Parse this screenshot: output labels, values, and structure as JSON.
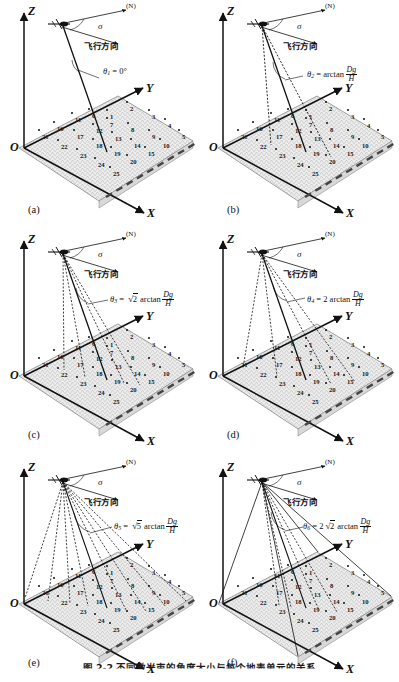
{
  "figure": {
    "caption": "图 2-2  不同激光束的角度大小与每个地表单元的关系",
    "axes": {
      "z": "Z",
      "y": "Y",
      "x": "X",
      "origin": "O"
    },
    "annotations": {
      "north": "(N)",
      "sigma": "σ",
      "flight_direction": "飞行方向",
      "arctan": "arctan",
      "dg": "Dg",
      "h": "H"
    },
    "cell_numbers": [
      1,
      2,
      3,
      4,
      5,
      6,
      7,
      8,
      9,
      10,
      11,
      12,
      13,
      14,
      15,
      16,
      17,
      18,
      19,
      20,
      21,
      22,
      23,
      24,
      25
    ],
    "panels": [
      {
        "id": "(a)",
        "theta_symbol": "θ",
        "theta_index": "1",
        "equation_text": "θ₁ = 0°",
        "coefficient": "",
        "value": "0°",
        "beam_count": 1,
        "beam_spread_deg": 0
      },
      {
        "id": "(b)",
        "theta_symbol": "θ",
        "theta_index": "2",
        "equation_text": "θ₂ = arctan Dg/H",
        "coefficient": "",
        "value": "arctan Dg/H",
        "beam_count": 3,
        "beam_spread_deg": 14
      },
      {
        "id": "(c)",
        "theta_symbol": "θ",
        "theta_index": "3",
        "equation_text": "θ₃ = √2 arctan Dg/H",
        "coefficient": "√2",
        "value": "arctan Dg/H",
        "beam_count": 5,
        "beam_spread_deg": 20
      },
      {
        "id": "(d)",
        "theta_symbol": "θ",
        "theta_index": "4",
        "equation_text": "θ₄ = 2 arctan Dg/H",
        "coefficient": "2",
        "value": "arctan Dg/H",
        "beam_count": 5,
        "beam_spread_deg": 28
      },
      {
        "id": "(e)",
        "theta_symbol": "θ",
        "theta_index": "5",
        "equation_text": "θ₅ = √5 arctan Dg/H",
        "coefficient": "√5",
        "value": "arctan Dg/H",
        "beam_count": 9,
        "beam_spread_deg": 32
      },
      {
        "id": "(f)",
        "theta_symbol": "θ",
        "theta_index": "6",
        "equation_text": "θ₆ = 2√2 arctan Dg/H",
        "coefficient": "2√2",
        "value": "arctan Dg/H",
        "beam_count": 9,
        "beam_spread_deg": 40
      }
    ],
    "colors": {
      "ink": "#111111",
      "terrain": "#8d8d8d",
      "surface_fill": "#e9e9e9"
    }
  }
}
